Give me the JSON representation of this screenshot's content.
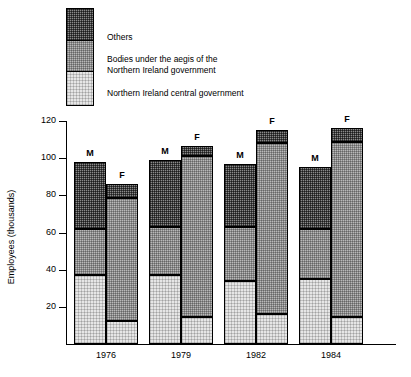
{
  "legend": {
    "items": [
      {
        "key": "others",
        "label": "Others",
        "swatch": "dark-stipple-swatch"
      },
      {
        "key": "bodies",
        "label": "Bodies under the aegis of the\nNorthern Ireland government",
        "swatch": "mid-stipple-swatch"
      },
      {
        "key": "central",
        "label": "Northern Ireland central government",
        "swatch": "light-stipple-swatch"
      }
    ]
  },
  "axes": {
    "ylabel": "Employees (thousands)",
    "yticks": [
      "120",
      "100",
      "80",
      "60",
      "40",
      "20"
    ],
    "ytick_values": [
      120,
      100,
      80,
      60,
      40,
      20
    ],
    "xlabels": [
      "1976",
      "1979",
      "1982",
      "1984"
    ]
  },
  "series_labels": {
    "male": "M",
    "female": "F"
  },
  "colors": {
    "others": "#8a8a8a",
    "bodies": "#b9b9b9",
    "central": "#e6e6e6",
    "outline": "#000000",
    "background": "#ffffff"
  },
  "chart_data": {
    "type": "bar",
    "title": "",
    "subtitle": "",
    "xlabel": "",
    "ylabel": "Employees (thousands)",
    "ylim": [
      0,
      120
    ],
    "ytick_step": 20,
    "grid": false,
    "legend_position": "top-left",
    "stacked": true,
    "grouped_by": "sex",
    "categories": [
      "1976",
      "1979",
      "1982",
      "1984"
    ],
    "groups": [
      "M",
      "F"
    ],
    "series": [
      {
        "name": "Northern Ireland central government",
        "values_male": [
          37,
          37,
          34,
          35
        ],
        "values_female": [
          12.5,
          14.5,
          16,
          14.5
        ]
      },
      {
        "name": "Bodies under the aegis of the Northern Ireland government",
        "values_male": [
          25,
          26,
          29,
          27
        ],
        "values_female": [
          66,
          86.5,
          92,
          94
        ]
      },
      {
        "name": "Others",
        "values_male": [
          36,
          36,
          34,
          33
        ],
        "values_female": [
          7.5,
          5.5,
          7,
          7.5
        ]
      }
    ],
    "totals": {
      "male": [
        98,
        99,
        97,
        95
      ],
      "female": [
        86,
        106.5,
        115,
        116
      ]
    },
    "cumulative_tops": {
      "male": {
        "central": [
          37,
          37,
          34,
          35
        ],
        "bodies": [
          62,
          63,
          63,
          62
        ],
        "others": [
          98,
          99,
          97,
          95
        ]
      },
      "female": {
        "central": [
          12.5,
          14.5,
          16,
          14.5
        ],
        "bodies": [
          78.5,
          101,
          108,
          108.5
        ],
        "others": [
          86,
          106.5,
          115,
          116
        ]
      }
    }
  },
  "bars": [
    {
      "year": "1976",
      "sex": "M",
      "x": 74,
      "w": 32,
      "central": 37,
      "bodies_top": 62,
      "total": 98
    },
    {
      "year": "1976",
      "sex": "F",
      "x": 106,
      "w": 32,
      "central": 12.5,
      "bodies_top": 78.5,
      "total": 86
    },
    {
      "year": "1976",
      "sex": "M2",
      "x": 0,
      "w": 0,
      "central": 0,
      "bodies_top": 0,
      "total": 0
    }
  ]
}
